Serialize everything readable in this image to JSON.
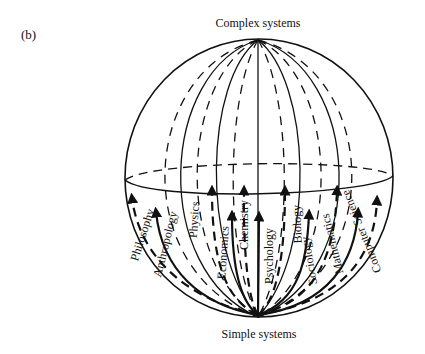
{
  "figure": {
    "panel_label": "(b)",
    "top_label": "Complex systems",
    "bottom_label": "Simple systems",
    "disciplines": [
      {
        "label": "Philosophy",
        "x": 146,
        "y": 236,
        "angle": -72
      },
      {
        "label": "Anthropology",
        "x": 169,
        "y": 245,
        "angle": -76
      },
      {
        "label": "Physics",
        "x": 198,
        "y": 220,
        "angle": -86
      },
      {
        "label": "Economics",
        "x": 227,
        "y": 253,
        "angle": -86
      },
      {
        "label": "Chemistry",
        "x": 248,
        "y": 225,
        "angle": -90
      },
      {
        "label": "Psychology",
        "x": 273,
        "y": 256,
        "angle": -90
      },
      {
        "label": "Biology",
        "x": 301,
        "y": 224,
        "angle": -92
      },
      {
        "label": "Sociology",
        "x": 313,
        "y": 260,
        "angle": -100
      },
      {
        "label": "Mathematics",
        "x": 336,
        "y": 243,
        "angle": -104
      },
      {
        "label": "Computer Science",
        "x": 365,
        "y": 230,
        "angle": -112
      }
    ],
    "colors": {
      "ink": "#111111",
      "background": "#ffffff"
    }
  }
}
